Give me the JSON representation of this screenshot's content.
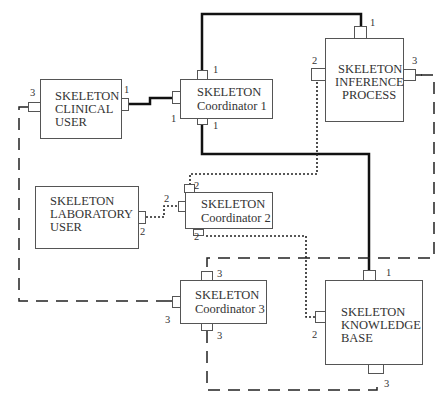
{
  "diagram": {
    "nodes": [
      {
        "id": "clinical-user",
        "lines": [
          "SKELETON",
          "CLINICAL",
          "USER"
        ]
      },
      {
        "id": "coordinator-1",
        "lines": [
          "SKELETON",
          "Coordinator 1"
        ]
      },
      {
        "id": "inference-process",
        "lines": [
          "SKELETON",
          "INFERENCE",
          "PROCESS"
        ]
      },
      {
        "id": "laboratory-user",
        "lines": [
          "SKELETON",
          "LABORATORY",
          "USER"
        ]
      },
      {
        "id": "coordinator-2",
        "lines": [
          "SKELETON",
          "Coordinator 2"
        ]
      },
      {
        "id": "coordinator-3",
        "lines": [
          "SKELETON",
          "Coordinator 3"
        ]
      },
      {
        "id": "knowledge-base",
        "lines": [
          "SKELETON",
          "KNOWLEDGE",
          "BASE"
        ]
      }
    ],
    "ports": {
      "clinical_user_left": "3",
      "clinical_user_right": "1",
      "coord1_top": "1",
      "coord1_left": "1",
      "coord1_bottom": "1",
      "inference_top": "1",
      "inference_left": "2",
      "inference_right": "3",
      "lab_user_right": "2",
      "coord2_left": "2",
      "coord2_top": "2",
      "coord2_bottom": "2",
      "coord3_top": "3",
      "coord3_left": "3",
      "coord3_bottom": "3",
      "kb_top": "1",
      "kb_left": "2",
      "kb_bottom": "3"
    },
    "edges": [
      {
        "from": "clinical-user:1",
        "to": "coordinator-1:1",
        "style": "thick-solid"
      },
      {
        "from": "coordinator-1:1(top)",
        "to": "inference-process:1",
        "style": "thick-solid"
      },
      {
        "from": "coordinator-1:1(bottom)",
        "to": "knowledge-base:1",
        "style": "thick-solid"
      },
      {
        "from": "laboratory-user:2",
        "to": "coordinator-2:2",
        "style": "dotted"
      },
      {
        "from": "coordinator-2:2(top)",
        "to": "inference-process:2",
        "style": "dotted"
      },
      {
        "from": "coordinator-2:2(bottom)",
        "to": "knowledge-base:2",
        "style": "dotted"
      },
      {
        "from": "clinical-user:3",
        "to": "coordinator-3:3",
        "style": "dashed"
      },
      {
        "from": "coordinator-3:3(top)",
        "to": "inference-process:3",
        "style": "dashed"
      },
      {
        "from": "coordinator-3:3(bottom)",
        "to": "knowledge-base:3",
        "style": "dashed"
      }
    ]
  }
}
